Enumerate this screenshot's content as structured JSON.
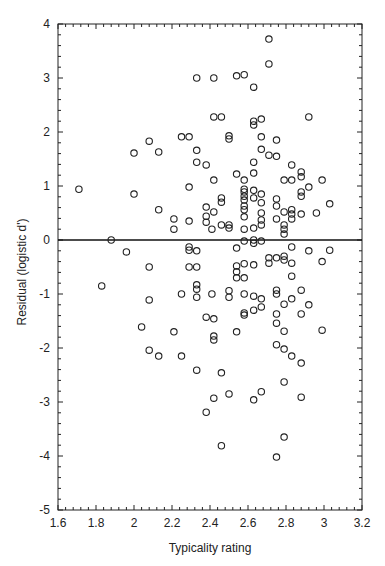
{
  "chart_data": {
    "type": "scatter",
    "title": "",
    "xlabel": "Typicality rating",
    "ylabel": "Residual (logistic d')",
    "xlim": [
      1.6,
      3.2
    ],
    "ylim": [
      -5,
      4
    ],
    "xticks": [
      "1.6",
      "1.8",
      "2",
      "2.2",
      "2.4",
      "2.6",
      "2.8",
      "3",
      "3.2"
    ],
    "yticks": [
      "-5",
      "-4",
      "-3",
      "-2",
      "-1",
      "0",
      "1",
      "2",
      "3",
      "4"
    ],
    "grid": false,
    "legend": null,
    "reference_line": {
      "y": 0,
      "label": "zero residual"
    },
    "marker": "open-circle",
    "points": [
      [
        1.71,
        0.94
      ],
      [
        2.0,
        1.61
      ],
      [
        2.08,
        1.83
      ],
      [
        2.13,
        1.63
      ],
      [
        2.0,
        0.85
      ],
      [
        2.13,
        0.56
      ],
      [
        1.88,
        0.0
      ],
      [
        1.96,
        -0.22
      ],
      [
        2.08,
        -0.5
      ],
      [
        1.83,
        -0.85
      ],
      [
        2.08,
        -1.11
      ],
      [
        2.04,
        -1.61
      ],
      [
        2.21,
        -1.7
      ],
      [
        2.08,
        -2.04
      ],
      [
        2.13,
        -2.15
      ],
      [
        2.25,
        -2.15
      ],
      [
        2.71,
        3.72
      ],
      [
        2.71,
        3.26
      ],
      [
        2.33,
        3.0
      ],
      [
        2.42,
        3.0
      ],
      [
        2.54,
        3.04
      ],
      [
        2.58,
        3.06
      ],
      [
        2.63,
        2.83
      ],
      [
        2.42,
        2.28
      ],
      [
        2.46,
        2.28
      ],
      [
        2.63,
        2.2
      ],
      [
        2.63,
        2.13
      ],
      [
        2.67,
        2.24
      ],
      [
        2.92,
        2.28
      ],
      [
        2.25,
        1.91
      ],
      [
        2.29,
        1.91
      ],
      [
        2.5,
        1.93
      ],
      [
        2.5,
        1.87
      ],
      [
        2.67,
        1.91
      ],
      [
        2.75,
        1.85
      ],
      [
        2.33,
        1.66
      ],
      [
        2.67,
        1.68
      ],
      [
        2.71,
        1.57
      ],
      [
        2.75,
        1.55
      ],
      [
        2.33,
        1.44
      ],
      [
        2.38,
        1.39
      ],
      [
        2.63,
        1.44
      ],
      [
        2.54,
        1.22
      ],
      [
        2.63,
        1.24
      ],
      [
        2.42,
        1.11
      ],
      [
        2.58,
        1.11
      ],
      [
        2.29,
        0.98
      ],
      [
        2.58,
        0.94
      ],
      [
        2.58,
        0.89
      ],
      [
        2.58,
        0.81
      ],
      [
        2.63,
        0.92
      ],
      [
        2.67,
        0.85
      ],
      [
        2.46,
        0.78
      ],
      [
        2.46,
        0.7
      ],
      [
        2.58,
        0.74
      ],
      [
        2.63,
        0.78
      ],
      [
        2.67,
        0.69
      ],
      [
        2.75,
        0.76
      ],
      [
        2.38,
        0.61
      ],
      [
        2.58,
        0.56
      ],
      [
        2.58,
        0.63
      ],
      [
        2.42,
        0.52
      ],
      [
        2.58,
        0.43
      ],
      [
        2.67,
        0.5
      ],
      [
        2.67,
        0.37
      ],
      [
        2.75,
        0.63
      ],
      [
        2.38,
        0.44
      ],
      [
        2.21,
        0.39
      ],
      [
        2.29,
        0.35
      ],
      [
        2.38,
        0.33
      ],
      [
        2.46,
        0.28
      ],
      [
        2.5,
        0.28
      ],
      [
        2.67,
        0.28
      ],
      [
        2.41,
        0.2
      ],
      [
        2.5,
        0.22
      ],
      [
        2.58,
        0.2
      ],
      [
        2.63,
        0.22
      ],
      [
        2.21,
        0.2
      ],
      [
        2.75,
        0.39
      ],
      [
        2.83,
        1.39
      ],
      [
        2.88,
        1.26
      ],
      [
        2.88,
        1.17
      ],
      [
        2.79,
        1.11
      ],
      [
        2.83,
        1.11
      ],
      [
        2.99,
        1.11
      ],
      [
        2.92,
        0.98
      ],
      [
        2.88,
        0.89
      ],
      [
        2.88,
        0.81
      ],
      [
        3.03,
        0.67
      ],
      [
        2.79,
        0.52
      ],
      [
        2.83,
        0.56
      ],
      [
        2.83,
        0.48
      ],
      [
        2.88,
        0.48
      ],
      [
        2.96,
        0.5
      ],
      [
        2.83,
        0.39
      ],
      [
        2.79,
        0.28
      ],
      [
        2.79,
        0.2
      ],
      [
        2.79,
        0.11
      ],
      [
        2.58,
        -0.02
      ],
      [
        2.63,
        0.0
      ],
      [
        2.63,
        -0.06
      ],
      [
        2.67,
        -0.02
      ],
      [
        2.29,
        -0.13
      ],
      [
        2.29,
        -0.19
      ],
      [
        2.33,
        -0.2
      ],
      [
        2.54,
        -0.15
      ],
      [
        2.71,
        -0.33
      ],
      [
        2.75,
        -0.33
      ],
      [
        2.71,
        -0.43
      ],
      [
        2.29,
        -0.5
      ],
      [
        2.33,
        -0.5
      ],
      [
        2.54,
        -0.48
      ],
      [
        2.54,
        -0.59
      ],
      [
        2.58,
        -0.44
      ],
      [
        2.63,
        -0.46
      ],
      [
        2.54,
        -0.7
      ],
      [
        2.58,
        -0.7
      ],
      [
        2.33,
        -0.83
      ],
      [
        2.33,
        -0.91
      ],
      [
        2.25,
        -1.0
      ],
      [
        2.33,
        -1.06
      ],
      [
        2.41,
        -1.0
      ],
      [
        2.5,
        -0.94
      ],
      [
        2.58,
        -1.0
      ],
      [
        2.63,
        -1.04
      ],
      [
        2.67,
        -1.09
      ],
      [
        2.75,
        -0.93
      ],
      [
        2.75,
        -1.0
      ],
      [
        2.83,
        -0.13
      ],
      [
        2.92,
        -0.2
      ],
      [
        3.03,
        -0.19
      ],
      [
        2.79,
        -0.3
      ],
      [
        2.79,
        -0.37
      ],
      [
        2.83,
        -0.43
      ],
      [
        2.99,
        -0.4
      ],
      [
        2.83,
        -0.67
      ],
      [
        2.88,
        -0.93
      ],
      [
        2.79,
        -1.19
      ],
      [
        2.83,
        -1.09
      ],
      [
        2.92,
        -1.2
      ],
      [
        2.88,
        -1.37
      ],
      [
        2.79,
        -1.69
      ],
      [
        2.99,
        -1.67
      ],
      [
        2.5,
        -1.06
      ],
      [
        2.67,
        -1.24
      ],
      [
        2.63,
        -1.3
      ],
      [
        2.58,
        -1.35
      ],
      [
        2.58,
        -1.39
      ],
      [
        2.38,
        -1.43
      ],
      [
        2.42,
        -1.46
      ],
      [
        2.75,
        -1.37
      ],
      [
        2.75,
        -1.54
      ],
      [
        2.42,
        -1.78
      ],
      [
        2.42,
        -1.85
      ],
      [
        2.54,
        -1.7
      ],
      [
        2.75,
        -1.94
      ],
      [
        2.79,
        -2.02
      ],
      [
        2.83,
        -2.15
      ],
      [
        2.88,
        -2.28
      ],
      [
        2.33,
        -2.41
      ],
      [
        2.46,
        -2.46
      ],
      [
        2.79,
        -2.63
      ],
      [
        2.42,
        -2.93
      ],
      [
        2.5,
        -2.85
      ],
      [
        2.67,
        -2.81
      ],
      [
        2.63,
        -2.96
      ],
      [
        2.88,
        -2.91
      ],
      [
        2.38,
        -3.19
      ],
      [
        2.79,
        -3.65
      ],
      [
        2.46,
        -3.81
      ],
      [
        2.75,
        -4.02
      ]
    ]
  },
  "layout": {
    "plot_left": 58,
    "plot_right": 362,
    "plot_top": 24,
    "plot_bottom": 510,
    "colors": {
      "axis": "#222222",
      "marker": "#222222",
      "background": "#ffffff"
    }
  }
}
